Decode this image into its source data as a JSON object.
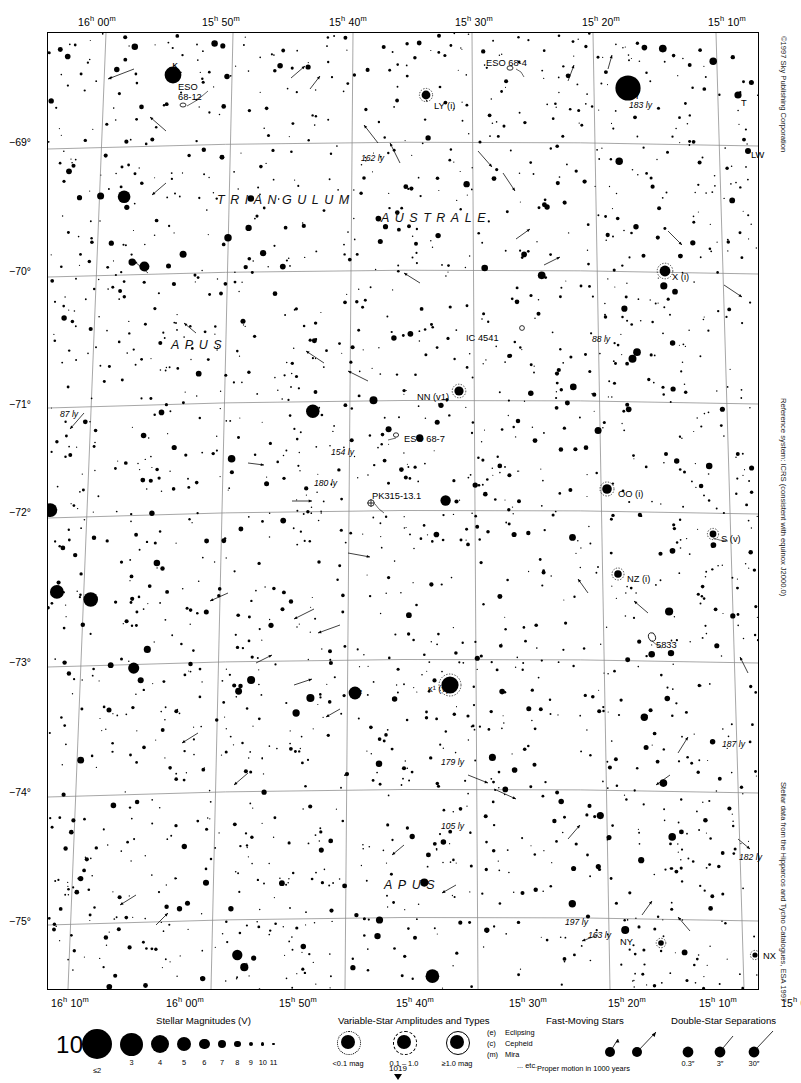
{
  "page": {
    "number": "1009",
    "bottom_index": "1019"
  },
  "axes": {
    "ra_top": [
      {
        "label": "16h 00m",
        "h": "16",
        "m": "00",
        "x": 97
      },
      {
        "label": "15h 50m",
        "h": "15",
        "m": "50",
        "x": 221
      },
      {
        "label": "15h 40m",
        "h": "15",
        "m": "40",
        "x": 348
      },
      {
        "label": "15h 30m",
        "h": "15",
        "m": "30",
        "x": 474
      },
      {
        "label": "15h 20m",
        "h": "15",
        "m": "20",
        "x": 601
      },
      {
        "label": "15h 10m",
        "h": "15",
        "m": "10",
        "x": 727
      }
    ],
    "ra_bottom": [
      {
        "label": "16h 10m",
        "h": "16",
        "m": "10",
        "x": 70
      },
      {
        "label": "16h 00m",
        "h": "16",
        "m": "00",
        "x": 185
      },
      {
        "label": "15h 50m",
        "h": "15",
        "m": "50",
        "x": 298
      },
      {
        "label": "15h 40m",
        "h": "15",
        "m": "40",
        "x": 415
      },
      {
        "label": "15h 30m",
        "h": "15",
        "m": "30",
        "x": 528
      },
      {
        "label": "15h 20m",
        "h": "15",
        "m": "20",
        "x": 627
      },
      {
        "label": "15h 10m",
        "h": "15",
        "m": "10",
        "x": 718
      },
      {
        "label": "15h 00m",
        "h": "15",
        "m": "00",
        "x": 800
      }
    ],
    "dec_left": [
      {
        "label": "−69°",
        "y": 142
      },
      {
        "label": "−70°",
        "y": 271
      },
      {
        "label": "−71°",
        "y": 404
      },
      {
        "label": "−72°",
        "y": 512
      },
      {
        "label": "−73°",
        "y": 662
      },
      {
        "label": "−74°",
        "y": 792
      },
      {
        "label": "−75°",
        "y": 921
      }
    ]
  },
  "constellations": [
    {
      "name": "TRIANGULUM",
      "x": 216,
      "y": 192
    },
    {
      "name": "AUSTRALE",
      "x": 380,
      "y": 210
    },
    {
      "name": "APUS",
      "x": 170,
      "y": 337
    },
    {
      "name": "APUS",
      "x": 383,
      "y": 877
    }
  ],
  "objects": [
    {
      "name": "κ",
      "type": "star-greek",
      "x": 172,
      "y": 60
    },
    {
      "name": "ESO 68-12",
      "type": "galaxy",
      "x": 178,
      "y": 82
    },
    {
      "name": "ESO 68-4",
      "type": "galaxy",
      "x": 486,
      "y": 58
    },
    {
      "name": "LY (i)",
      "type": "variable-star",
      "x": 434,
      "y": 101
    },
    {
      "name": "γ",
      "type": "star-greek",
      "x": 634,
      "y": 88
    },
    {
      "name": "T",
      "type": "variable-star",
      "x": 741,
      "y": 98
    },
    {
      "name": "LW",
      "type": "variable-star",
      "x": 751,
      "y": 150
    },
    {
      "name": "X (i)",
      "type": "variable-star",
      "x": 672,
      "y": 272
    },
    {
      "name": "IC 4541",
      "type": "planetary-nebula",
      "x": 466,
      "y": 333
    },
    {
      "name": "NN (v1)",
      "type": "variable-star",
      "x": 417,
      "y": 392
    },
    {
      "name": "ESO 68-7",
      "type": "galaxy",
      "x": 404,
      "y": 434
    },
    {
      "name": "PK315-13.1",
      "type": "planetary-nebula",
      "x": 372,
      "y": 491
    },
    {
      "name": "OO (i)",
      "type": "variable-star",
      "x": 618,
      "y": 489
    },
    {
      "name": "S (v)",
      "type": "variable-star",
      "x": 721,
      "y": 534
    },
    {
      "name": "NZ (i)",
      "type": "variable-star",
      "x": 627,
      "y": 574
    },
    {
      "name": "5833",
      "type": "galaxy",
      "x": 656,
      "y": 640
    },
    {
      "name": "κ²",
      "type": "star-greek",
      "x": 352,
      "y": 689
    },
    {
      "name": "κ¹ (v)",
      "type": "variable-star",
      "x": 428,
      "y": 684
    },
    {
      "name": "NY",
      "type": "variable-star",
      "x": 620,
      "y": 937
    },
    {
      "name": "NX",
      "type": "variable-star",
      "x": 763,
      "y": 951
    }
  ],
  "distance_labels": [
    {
      "value": "162 ly",
      "x": 361,
      "y": 153
    },
    {
      "value": "183 ly",
      "x": 629,
      "y": 100
    },
    {
      "value": "88 ly",
      "x": 592,
      "y": 334
    },
    {
      "value": "87 ly",
      "x": 60,
      "y": 409
    },
    {
      "value": "154 ly",
      "x": 331,
      "y": 447
    },
    {
      "value": "180 ly",
      "x": 314,
      "y": 478
    },
    {
      "value": "187 ly",
      "x": 722,
      "y": 739
    },
    {
      "value": "179 ly",
      "x": 441,
      "y": 757
    },
    {
      "value": "105 ly",
      "x": 441,
      "y": 821
    },
    {
      "value": "182 ly",
      "x": 739,
      "y": 852
    },
    {
      "value": "197 ly",
      "x": 565,
      "y": 917
    },
    {
      "value": "163 ly",
      "x": 588,
      "y": 930
    }
  ],
  "credits": {
    "copyright": "©1997 Sky Publishing Corporation",
    "reference": "Reference system: ICRS (consistent with equinox J2000.0)",
    "source": "Stellar data from the Hipparcos and Tycho Catalogues, ESA 1997"
  },
  "legend": {
    "magnitudes": {
      "title": "Stellar Magnitudes (V)",
      "labels": [
        "≤2",
        "3",
        "4",
        "5",
        "6",
        "7",
        "8",
        "9",
        "10",
        "11"
      ]
    },
    "variables": {
      "title": "Variable-Star Amplitudes and Types",
      "amplitudes": [
        "<0.1 mag",
        "0.1 – 1.0",
        "≥1.0 mag"
      ],
      "types": [
        {
          "code": "(e)",
          "name": "Eclipsing"
        },
        {
          "code": "(c)",
          "name": "Cepheid"
        },
        {
          "code": "(m)",
          "name": "Mira"
        },
        {
          "code": "",
          "name": "... etc."
        }
      ]
    },
    "fast_moving": {
      "title": "Fast-Moving Stars",
      "caption": "Proper motion in 1000 years"
    },
    "double_stars": {
      "title": "Double-Star Separations",
      "labels": [
        "0.3″",
        "3″",
        "30″"
      ]
    }
  },
  "chart_data": {
    "type": "scatter",
    "xlabel": "Right Ascension",
    "ylabel": "Declination",
    "xlim": [
      "16h 10m",
      "15h 00m"
    ],
    "ylim": [
      -75.5,
      -68.5
    ],
    "grid": true,
    "legend_position": "bottom"
  }
}
